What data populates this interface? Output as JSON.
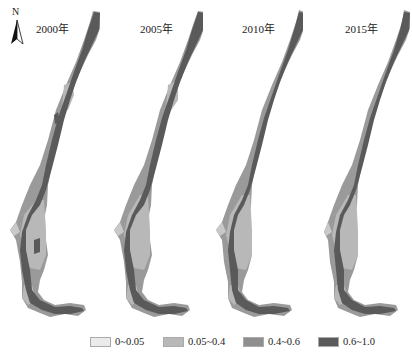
{
  "figure": {
    "north_arrow": {
      "label": "N",
      "icon": "north-arrow-icon"
    },
    "panels": [
      {
        "year_label": "2000年"
      },
      {
        "year_label": "2005年"
      },
      {
        "year_label": "2010年"
      },
      {
        "year_label": "2015年"
      }
    ],
    "legend": {
      "items": [
        {
          "label": "0~0.05",
          "color": "#ebebeb"
        },
        {
          "label": "0.05~0.4",
          "color": "#b8b8b8"
        },
        {
          "label": "0.4~0.6",
          "color": "#8f8f8f"
        },
        {
          "label": "0.6~1.0",
          "color": "#5a5a5a"
        }
      ]
    },
    "colors": {
      "class_0_0_05": "#ebebeb",
      "class_0_05_0_4": "#b8b8b8",
      "class_0_4_0_6": "#8f8f8f",
      "class_0_6_1_0": "#5a5a5a"
    }
  }
}
